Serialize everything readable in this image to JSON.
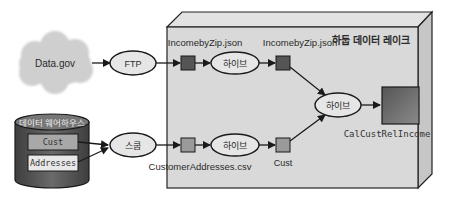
{
  "diagram": {
    "lake": {
      "title": "하둡 데이터 레이크",
      "face_color": "#d9d9d9",
      "side_color": "#c8c8c8",
      "top_color": "#e2e2e2"
    },
    "sources": {
      "datagov": {
        "label": "Data.gov",
        "color": "#cfcfcf"
      },
      "warehouse": {
        "label": "데이터 웨어하우스",
        "color": "#5a5a5a",
        "tables": [
          {
            "label": "Cust",
            "color": "#a8a8a8"
          },
          {
            "label": "Addresses",
            "color": "#e8e8e8"
          }
        ]
      }
    },
    "processes": {
      "ftp": "FTP",
      "sqoop": "스쿱",
      "hive_top": "하이브",
      "hive_bottom": "하이브",
      "hive_center": "하이브",
      "ellipse_fill": "#e6e6e6"
    },
    "datasets": {
      "income_raw": {
        "label": "IncomebyZip.json",
        "color": "#555555"
      },
      "income_processed": {
        "label": "IncomebyZip.json",
        "color": "#555555"
      },
      "cust_raw": {
        "label": "CustomerAddresses.csv",
        "color": "#9a9a9a"
      },
      "cust_processed": {
        "label": "Cust",
        "color": "#9a9a9a"
      },
      "result": {
        "label": "CalCustRelIncome",
        "color": "#6e6e6e"
      }
    }
  }
}
